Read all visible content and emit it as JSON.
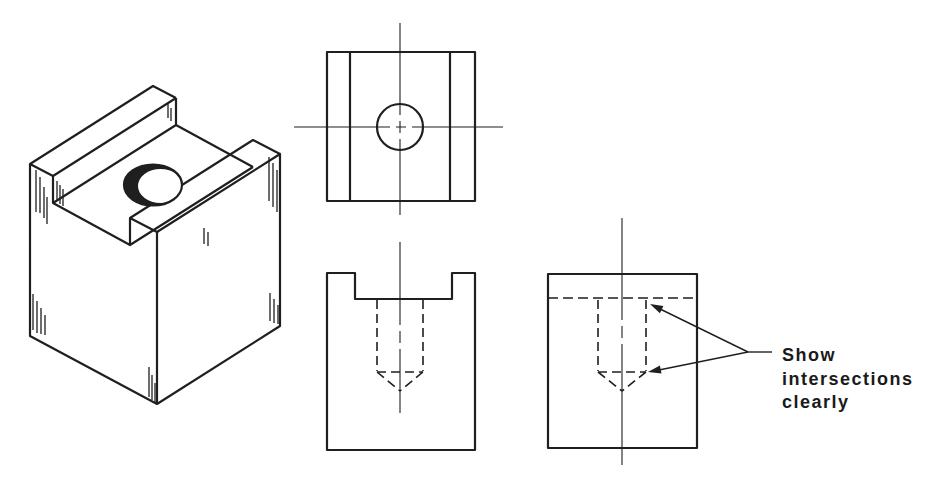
{
  "figure": {
    "background_color": "#ffffff",
    "line_color": "#1f1f1f",
    "annotation": {
      "lines": [
        "Show",
        "intersections",
        "clearly"
      ]
    }
  }
}
